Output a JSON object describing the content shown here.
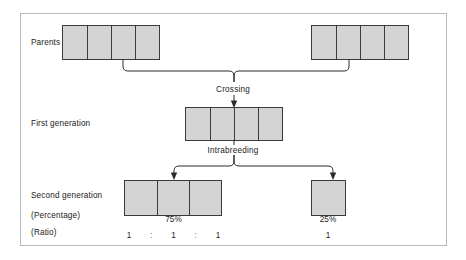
{
  "diagram": {
    "frame_color": "#b9b9b9",
    "box_fill_color": "#d4d4d4",
    "box_stroke_color": "#3a3a3a",
    "connector_color": "#2b2b2b"
  },
  "rows": {
    "parents": {
      "label": "Parents"
    },
    "first_generation": {
      "label": "First generation"
    },
    "second_generation": {
      "label": "Second generation"
    },
    "percentage": {
      "label": "(Percentage)"
    },
    "ratio": {
      "label": "(Ratio)"
    }
  },
  "processes": {
    "crossing": {
      "label": "Crossing"
    },
    "intrabreeding": {
      "label": "Intrabreeding"
    }
  },
  "groups": {
    "parent_left": {
      "name": "parent-left-chromosome",
      "cells": 4,
      "cell_width": 24
    },
    "parent_right": {
      "name": "parent-right-chromosome",
      "cells": 4,
      "cell_width": 24
    },
    "first_gen": {
      "name": "first-generation-chromosome",
      "cells": 4,
      "cell_width": 24
    },
    "second_gen_left": {
      "name": "second-generation-dominant-chromosome",
      "cells": 3,
      "cell_width": 32
    },
    "second_gen_right": {
      "name": "second-generation-recessive-chromosome",
      "cells": 1,
      "cell_width": 33
    }
  },
  "values": {
    "percentage_left": "75%",
    "percentage_right": "25%",
    "ratio_left_1": "1",
    "ratio_sep_1": ":",
    "ratio_left_2": "1",
    "ratio_sep_2": ":",
    "ratio_left_3": "1",
    "ratio_right": "1"
  }
}
